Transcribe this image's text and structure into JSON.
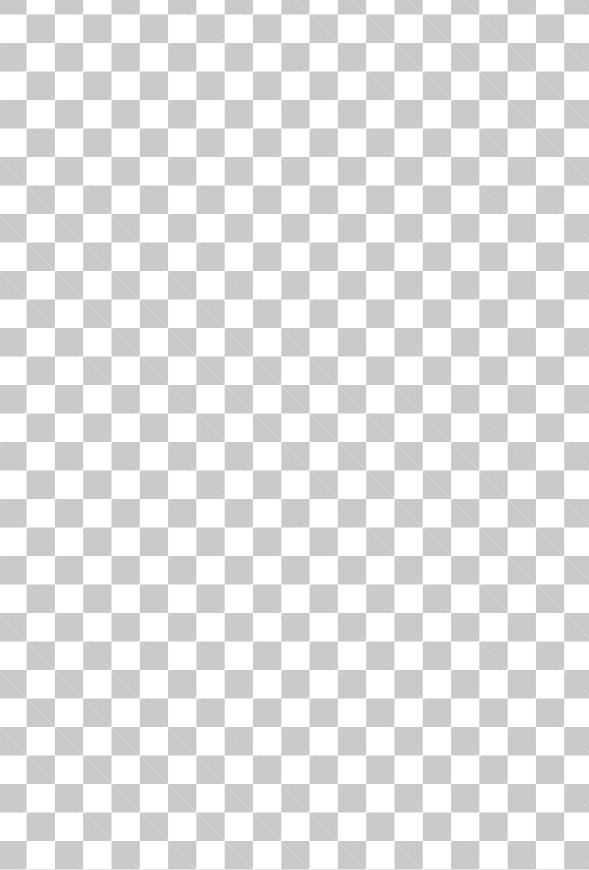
{
  "canvas": {
    "pattern": "transparency-checkerboard",
    "cell_size_px": 28.3,
    "colors": {
      "light": "#ffffff",
      "dark": "#c9c9c9"
    }
  }
}
